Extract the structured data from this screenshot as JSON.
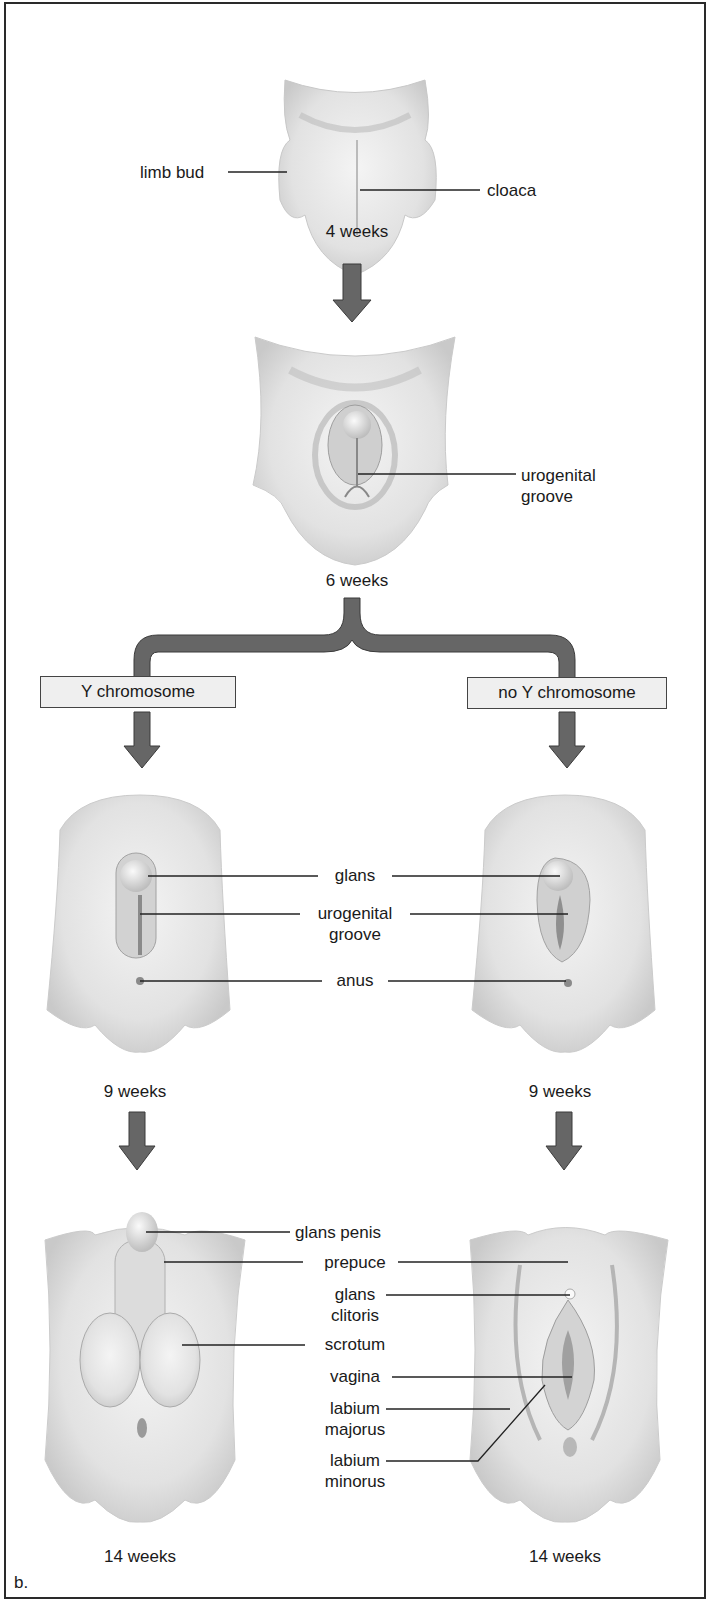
{
  "figure": {
    "panel_letter": "b.",
    "colors": {
      "arrow": "#666666",
      "arrow_edge": "#3a3a3a",
      "box_fill": "#efefef",
      "border": "#2a2a2a",
      "tissue": "#e4e4e4",
      "tissue_shade": "#b9b9b9"
    }
  },
  "stage_4wk": {
    "time": "4 weeks",
    "labels": {
      "limb_bud": "limb bud",
      "cloaca": "cloaca"
    }
  },
  "stage_6wk": {
    "time": "6 weeks",
    "labels": {
      "urogenital_groove_1": "urogenital",
      "urogenital_groove_2": "groove"
    }
  },
  "branches": {
    "left": "Y chromosome",
    "right": "no Y chromosome"
  },
  "stage_9wk": {
    "left_time": "9 weeks",
    "right_time": "9 weeks",
    "labels": {
      "glans": "glans",
      "urogenital_groove_1": "urogenital",
      "urogenital_groove_2": "groove",
      "anus": "anus"
    }
  },
  "stage_14wk": {
    "left_time": "14 weeks",
    "right_time": "14 weeks",
    "labels": {
      "glans_penis": "glans penis",
      "prepuce": "prepuce",
      "glans_clitoris_1": "glans",
      "glans_clitoris_2": "clitoris",
      "scrotum": "scrotum",
      "vagina": "vagina",
      "labium_majorus_1": "labium",
      "labium_majorus_2": "majorus",
      "labium_minorus_1": "labium",
      "labium_minorus_2": "minorus"
    }
  }
}
